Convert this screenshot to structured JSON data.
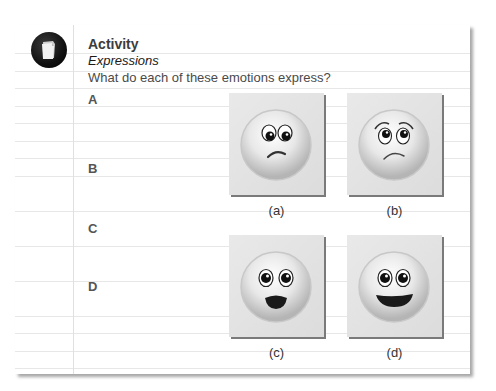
{
  "activity": {
    "icon": "document-stack-icon",
    "title": "Activity",
    "subtitle": "Expressions",
    "question": "What do each of these emotions express?"
  },
  "options": [
    {
      "label": "A"
    },
    {
      "label": "B"
    },
    {
      "label": "C"
    },
    {
      "label": "D"
    }
  ],
  "images": [
    {
      "caption": "(a)",
      "expression": "sad-frown-face"
    },
    {
      "caption": "(b)",
      "expression": "worried-face"
    },
    {
      "caption": "(c)",
      "expression": "surprised-open-mouth-face"
    },
    {
      "caption": "(d)",
      "expression": "happy-smile-face"
    }
  ],
  "colors": {
    "card_background": "#ffffff",
    "rule_lines": "#e7e7e7",
    "icon_background": "#111111",
    "panel_background": "#e3e3e3",
    "text": "#3a3a3a"
  }
}
